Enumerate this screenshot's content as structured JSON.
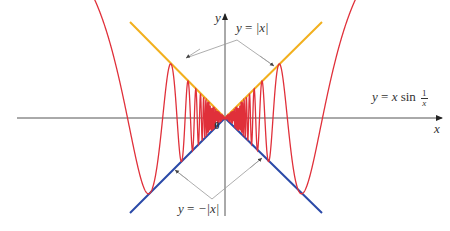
{
  "figure": {
    "axes": {
      "x_label": "x",
      "y_label": "y",
      "origin_label": "0"
    },
    "labels": {
      "upper_envelope": {
        "lhs": "y = ",
        "rhs": "|x|"
      },
      "lower_envelope": {
        "lhs": "y = ",
        "rhs": "−|x|"
      },
      "curve": {
        "lhs": "y = ",
        "x": "x",
        "fn": " sin ",
        "num": "1",
        "den": "x"
      }
    },
    "colors": {
      "curve": "#e0303a",
      "upper_envelope": "#f2b01e",
      "lower_envelope": "#2b4aa8",
      "axes": "#555555",
      "leader": "#999999"
    }
  }
}
